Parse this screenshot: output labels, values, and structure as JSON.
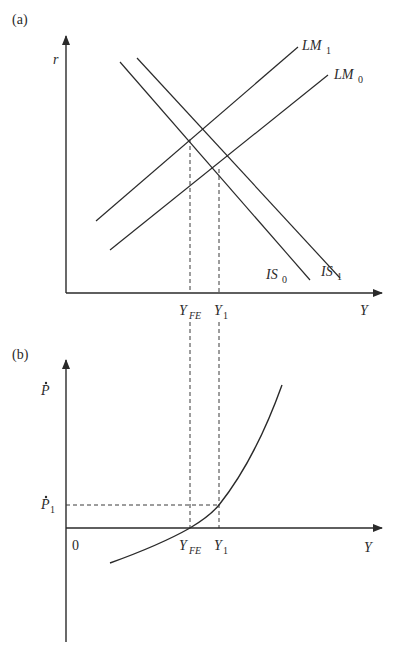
{
  "panel_a": {
    "tag": "(a)",
    "y_axis_label": "r",
    "x_axis_label": "Y",
    "curves": [
      {
        "name": "LM",
        "sub": "1",
        "kind": "upward"
      },
      {
        "name": "LM",
        "sub": "0",
        "kind": "upward"
      },
      {
        "name": "IS",
        "sub": "0",
        "kind": "downward"
      },
      {
        "name": "IS",
        "sub": "1",
        "kind": "downward"
      }
    ],
    "x_ticks": [
      {
        "main": "Y",
        "sub": "FE"
      },
      {
        "main": "Y",
        "sub": "1"
      }
    ]
  },
  "panel_b": {
    "tag": "(b)",
    "y_axis_label": "P",
    "y_axis_label_dot": "·",
    "x_axis_label": "Y",
    "origin_label": "0",
    "y_tick": {
      "main": "P",
      "sub": "1"
    },
    "x_ticks": [
      {
        "main": "Y",
        "sub": "FE"
      },
      {
        "main": "Y",
        "sub": "1"
      }
    ]
  },
  "colors": {
    "line": "#2a2a2a",
    "dashed": "#3a3a3a",
    "background": "#ffffff"
  }
}
